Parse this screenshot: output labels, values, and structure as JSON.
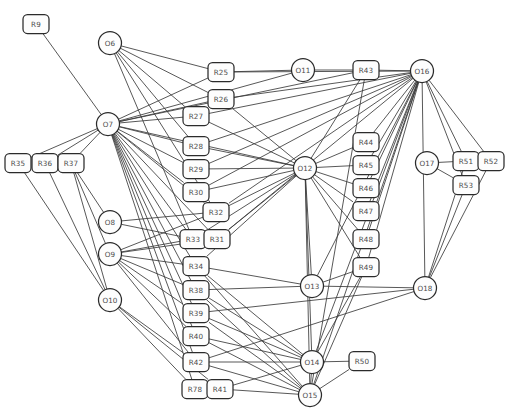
{
  "diagram": {
    "caption": "",
    "style": {
      "node_fill": "#fdfdfd",
      "node_stroke": "#2b2b2b",
      "edge_stroke": "#3a3a3a",
      "label_color": "#4a4a4a",
      "background": "#ffffff"
    },
    "legend": {
      "rect_shape_meaning": "R-nodes (rounded rectangles)",
      "circle_shape_meaning": "O-nodes (circles)"
    },
    "nodes": [
      {
        "id": "R9",
        "label": "R9",
        "shape": "rect",
        "x": 36,
        "y": 24
      },
      {
        "id": "O6",
        "label": "O6",
        "shape": "circle",
        "x": 110,
        "y": 43
      },
      {
        "id": "R25",
        "label": "R25",
        "shape": "rect",
        "x": 221,
        "y": 72
      },
      {
        "id": "O11",
        "label": "O11",
        "shape": "circle",
        "x": 303,
        "y": 70
      },
      {
        "id": "R43",
        "label": "R43",
        "shape": "rect",
        "x": 366,
        "y": 70
      },
      {
        "id": "O16",
        "label": "O16",
        "shape": "circle",
        "x": 422,
        "y": 71
      },
      {
        "id": "R26",
        "label": "R26",
        "shape": "rect",
        "x": 221,
        "y": 99
      },
      {
        "id": "O7",
        "label": "O7",
        "shape": "circle",
        "x": 108,
        "y": 124
      },
      {
        "id": "R27",
        "label": "R27",
        "shape": "rect",
        "x": 196,
        "y": 116
      },
      {
        "id": "R28",
        "label": "R28",
        "shape": "rect",
        "x": 196,
        "y": 146
      },
      {
        "id": "R44",
        "label": "R44",
        "shape": "rect",
        "x": 366,
        "y": 142
      },
      {
        "id": "O17",
        "label": "O17",
        "shape": "circle",
        "x": 427,
        "y": 163
      },
      {
        "id": "R51",
        "label": "R51",
        "shape": "rect",
        "x": 466,
        "y": 161
      },
      {
        "id": "R52",
        "label": "R52",
        "shape": "rect",
        "x": 491,
        "y": 161
      },
      {
        "id": "R35",
        "label": "R35",
        "shape": "rect",
        "x": 18,
        "y": 163
      },
      {
        "id": "R36",
        "label": "R36",
        "shape": "rect",
        "x": 45,
        "y": 163
      },
      {
        "id": "R37",
        "label": "R37",
        "shape": "rect",
        "x": 71,
        "y": 163
      },
      {
        "id": "R29",
        "label": "R29",
        "shape": "rect",
        "x": 196,
        "y": 169
      },
      {
        "id": "O12",
        "label": "O12",
        "shape": "circle",
        "x": 305,
        "y": 168
      },
      {
        "id": "R45",
        "label": "R45",
        "shape": "rect",
        "x": 366,
        "y": 165
      },
      {
        "id": "R53",
        "label": "R53",
        "shape": "rect",
        "x": 466,
        "y": 185
      },
      {
        "id": "R30",
        "label": "R30",
        "shape": "rect",
        "x": 196,
        "y": 192
      },
      {
        "id": "R46",
        "label": "R46",
        "shape": "rect",
        "x": 366,
        "y": 188
      },
      {
        "id": "R32",
        "label": "R32",
        "shape": "rect",
        "x": 216,
        "y": 212
      },
      {
        "id": "O8",
        "label": "O8",
        "shape": "circle",
        "x": 110,
        "y": 222
      },
      {
        "id": "R47",
        "label": "R47",
        "shape": "rect",
        "x": 366,
        "y": 211
      },
      {
        "id": "R33",
        "label": "R33",
        "shape": "rect",
        "x": 193,
        "y": 239
      },
      {
        "id": "R31",
        "label": "R31",
        "shape": "rect",
        "x": 217,
        "y": 239
      },
      {
        "id": "R48",
        "label": "R48",
        "shape": "rect",
        "x": 366,
        "y": 239
      },
      {
        "id": "O9",
        "label": "O9",
        "shape": "circle",
        "x": 110,
        "y": 254
      },
      {
        "id": "R34",
        "label": "R34",
        "shape": "rect",
        "x": 196,
        "y": 266
      },
      {
        "id": "R49",
        "label": "R49",
        "shape": "rect",
        "x": 366,
        "y": 267
      },
      {
        "id": "O13",
        "label": "O13",
        "shape": "circle",
        "x": 312,
        "y": 286
      },
      {
        "id": "O18",
        "label": "O18",
        "shape": "circle",
        "x": 425,
        "y": 288
      },
      {
        "id": "R38",
        "label": "R38",
        "shape": "rect",
        "x": 196,
        "y": 290
      },
      {
        "id": "O10",
        "label": "O10",
        "shape": "circle",
        "x": 110,
        "y": 300
      },
      {
        "id": "R39",
        "label": "R39",
        "shape": "rect",
        "x": 196,
        "y": 313
      },
      {
        "id": "R40",
        "label": "R40",
        "shape": "rect",
        "x": 196,
        "y": 336
      },
      {
        "id": "R42",
        "label": "R42",
        "shape": "rect",
        "x": 196,
        "y": 362
      },
      {
        "id": "O14",
        "label": "O14",
        "shape": "circle",
        "x": 312,
        "y": 362
      },
      {
        "id": "R50",
        "label": "R50",
        "shape": "rect",
        "x": 362,
        "y": 361
      },
      {
        "id": "R78",
        "label": "R78",
        "shape": "rect",
        "x": 195,
        "y": 389
      },
      {
        "id": "R41",
        "label": "R41",
        "shape": "rect",
        "x": 220,
        "y": 389
      },
      {
        "id": "O15",
        "label": "O15",
        "shape": "circle",
        "x": 310,
        "y": 395
      }
    ],
    "edges": [
      [
        "R9",
        "O7"
      ],
      [
        "O6",
        "R25"
      ],
      [
        "O6",
        "R26"
      ],
      [
        "O6",
        "R27"
      ],
      [
        "O6",
        "R28"
      ],
      [
        "O6",
        "R32"
      ],
      [
        "O6",
        "R33"
      ],
      [
        "O7",
        "R25"
      ],
      [
        "O7",
        "R26"
      ],
      [
        "O7",
        "R27"
      ],
      [
        "O7",
        "R28"
      ],
      [
        "O7",
        "R29"
      ],
      [
        "O7",
        "R30"
      ],
      [
        "O7",
        "R31"
      ],
      [
        "O7",
        "R32"
      ],
      [
        "O7",
        "R33"
      ],
      [
        "O7",
        "R34"
      ],
      [
        "O7",
        "R35"
      ],
      [
        "O7",
        "R36"
      ],
      [
        "O7",
        "R37"
      ],
      [
        "O7",
        "R38"
      ],
      [
        "O7",
        "R39"
      ],
      [
        "O7",
        "R40"
      ],
      [
        "O7",
        "R42"
      ],
      [
        "O7",
        "R78"
      ],
      [
        "O7",
        "O12"
      ],
      [
        "O7",
        "R43"
      ],
      [
        "R25",
        "O11"
      ],
      [
        "R25",
        "O16"
      ],
      [
        "R26",
        "O16"
      ],
      [
        "R26",
        "O12"
      ],
      [
        "R27",
        "O16"
      ],
      [
        "R27",
        "O12"
      ],
      [
        "R28",
        "O12"
      ],
      [
        "R28",
        "O16"
      ],
      [
        "R29",
        "O12"
      ],
      [
        "R29",
        "O16"
      ],
      [
        "R30",
        "O12"
      ],
      [
        "R30",
        "O16"
      ],
      [
        "R31",
        "O12"
      ],
      [
        "R32",
        "O12"
      ],
      [
        "R33",
        "O12"
      ],
      [
        "R34",
        "O12"
      ],
      [
        "O11",
        "R43"
      ],
      [
        "O11",
        "O7"
      ],
      [
        "R43",
        "O16"
      ],
      [
        "R43",
        "O12"
      ],
      [
        "R43",
        "O15"
      ],
      [
        "O16",
        "R44"
      ],
      [
        "O16",
        "R45"
      ],
      [
        "O16",
        "R46"
      ],
      [
        "O16",
        "R47"
      ],
      [
        "O16",
        "R48"
      ],
      [
        "O16",
        "R49"
      ],
      [
        "O16",
        "R51"
      ],
      [
        "O16",
        "R52"
      ],
      [
        "O16",
        "R53"
      ],
      [
        "O16",
        "O18"
      ],
      [
        "O16",
        "O13"
      ],
      [
        "O16",
        "O14"
      ],
      [
        "O16",
        "O15"
      ],
      [
        "O16",
        "R32"
      ],
      [
        "O16",
        "R31"
      ],
      [
        "O17",
        "R51"
      ],
      [
        "O17",
        "R53"
      ],
      [
        "R51",
        "O18"
      ],
      [
        "R52",
        "O18"
      ],
      [
        "R53",
        "O18"
      ],
      [
        "R35",
        "O10"
      ],
      [
        "R36",
        "O10"
      ],
      [
        "R37",
        "O10"
      ],
      [
        "R37",
        "O8"
      ],
      [
        "R37",
        "O9"
      ],
      [
        "O8",
        "R32"
      ],
      [
        "O8",
        "R33"
      ],
      [
        "O9",
        "R33"
      ],
      [
        "O9",
        "R34"
      ],
      [
        "O9",
        "R38"
      ],
      [
        "O9",
        "R39"
      ],
      [
        "O9",
        "R40"
      ],
      [
        "O9",
        "R42"
      ],
      [
        "O9",
        "R31"
      ],
      [
        "O9",
        "R32"
      ],
      [
        "O10",
        "R42"
      ],
      [
        "O10",
        "R78"
      ],
      [
        "O10",
        "R41"
      ],
      [
        "O12",
        "O13"
      ],
      [
        "O12",
        "O14"
      ],
      [
        "O12",
        "O15"
      ],
      [
        "O12",
        "R49"
      ],
      [
        "O13",
        "O18"
      ],
      [
        "O13",
        "R49"
      ],
      [
        "O13",
        "R38"
      ],
      [
        "R34",
        "O14"
      ],
      [
        "R34",
        "O15"
      ],
      [
        "R34",
        "O13"
      ],
      [
        "R38",
        "O14"
      ],
      [
        "R38",
        "O15"
      ],
      [
        "R39",
        "O14"
      ],
      [
        "R39",
        "O15"
      ],
      [
        "R39",
        "O18"
      ],
      [
        "R40",
        "O15"
      ],
      [
        "R40",
        "O14"
      ],
      [
        "R42",
        "O14"
      ],
      [
        "R42",
        "O15"
      ],
      [
        "R42",
        "O18"
      ],
      [
        "R78",
        "R41"
      ],
      [
        "R41",
        "O14"
      ],
      [
        "R41",
        "O15"
      ],
      [
        "O14",
        "R50"
      ],
      [
        "O15",
        "R50"
      ],
      [
        "O14",
        "O15"
      ],
      [
        "R49",
        "O15"
      ],
      [
        "R49",
        "O14"
      ],
      [
        "R47",
        "O12"
      ],
      [
        "R48",
        "O12"
      ],
      [
        "R44",
        "O12"
      ],
      [
        "R45",
        "O12"
      ],
      [
        "R46",
        "O12"
      ]
    ]
  }
}
